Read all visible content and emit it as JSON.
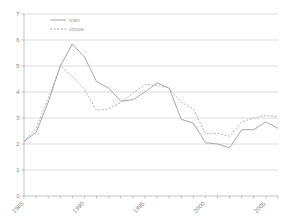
{
  "chart_data": {
    "type": "line",
    "title": "",
    "subtitle": "",
    "xlabel": "",
    "ylabel": "",
    "xlim": [
      1985,
      2006
    ],
    "ylim": [
      0,
      7
    ],
    "grid": true,
    "grid_axis": "y",
    "legend_position": "top-left",
    "y_ticks": [
      0,
      1,
      2,
      3,
      4,
      5,
      6,
      7
    ],
    "y_tick_labels": [
      "0",
      "1",
      "2",
      "3",
      "4",
      "5",
      "6",
      "7"
    ],
    "x_ticks": [
      1985,
      1990,
      1995,
      2000,
      2005
    ],
    "x_tick_labels": [
      "1985",
      "1990",
      "1995",
      "2000",
      "2005"
    ],
    "x_tick_label_rotation": -45,
    "x": [
      1985,
      1986,
      1987,
      1988,
      1989,
      1990,
      1991,
      1992,
      1993,
      1994,
      1995,
      1996,
      1997,
      1998,
      1999,
      2000,
      2001,
      2002,
      2003,
      2004,
      2005,
      2006
    ],
    "series": [
      {
        "name": "man",
        "style": "solid",
        "color": "#9a9a9a",
        "values": [
          2.1,
          2.45,
          3.6,
          5.0,
          5.85,
          5.35,
          4.4,
          4.15,
          3.65,
          3.7,
          4.0,
          4.35,
          4.15,
          2.95,
          2.8,
          2.05,
          2.0,
          1.85,
          2.55,
          2.55,
          2.85,
          2.6
        ]
      },
      {
        "name": "vrouw",
        "style": "dashed",
        "color": "#a8a8a8",
        "values": [
          2.1,
          2.6,
          3.75,
          5.0,
          4.6,
          4.1,
          3.3,
          3.35,
          3.6,
          3.95,
          4.3,
          4.25,
          4.15,
          3.6,
          3.35,
          2.4,
          2.4,
          2.3,
          2.85,
          3.0,
          3.1,
          3.05
        ]
      }
    ],
    "legend": [
      {
        "label": "man",
        "style": "solid"
      },
      {
        "label": "vrouw",
        "style": "dashed"
      }
    ]
  }
}
